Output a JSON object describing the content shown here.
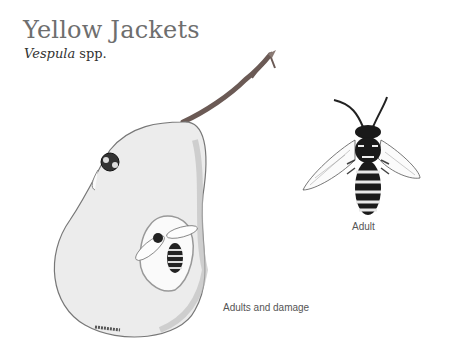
{
  "header": {
    "title": "Yellow Jackets",
    "scientific_name": "Vespula",
    "scientific_suffix": " spp."
  },
  "figures": [
    {
      "id": "adult",
      "caption": "Adult"
    },
    {
      "id": "damage",
      "caption": "Adults and damage"
    }
  ],
  "colors": {
    "title": "#6e6e6e",
    "pear_fill": "#ececec",
    "stem": "#6b5a55",
    "wasp_dark": "#1a1a1a"
  }
}
